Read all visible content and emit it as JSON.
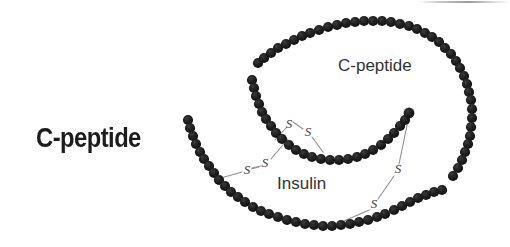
{
  "figure": {
    "name": "proinsulin-structure-diagram",
    "background_color": "#ffffff",
    "width": 510,
    "height": 247,
    "bead_color": "#1a1a1a",
    "bond_line_color": "#8a8a8a",
    "labels": {
      "main_c_peptide": "C-peptide",
      "inner_c_peptide": "C-peptide",
      "insulin": "Insulin"
    },
    "disulfide_bonds": [
      {
        "id": "bond-a6-a11-left",
        "left_label": "S",
        "right_label": "S"
      },
      {
        "id": "bond-a7-b7",
        "left_label": "S",
        "right_label": "S"
      },
      {
        "id": "bond-a20-b19",
        "left_label": "S",
        "right_label": "S"
      }
    ],
    "sulfur_glyphs": [
      {
        "id": "s-upper-left",
        "text": "S",
        "x": 287,
        "y": 124
      },
      {
        "id": "s-upper-right",
        "text": "S",
        "x": 307,
        "y": 133
      },
      {
        "id": "s-mid-left",
        "text": "S",
        "x": 245,
        "y": 170
      },
      {
        "id": "s-mid-right",
        "text": "S",
        "x": 263,
        "y": 163
      },
      {
        "id": "s-right-upper",
        "text": "S",
        "x": 397,
        "y": 170
      },
      {
        "id": "s-right-lower",
        "text": "S",
        "x": 373,
        "y": 205
      }
    ],
    "chains": [
      {
        "id": "c-peptide-outer-arc",
        "description": "outer spiral C-peptide chain",
        "beads": 78
      },
      {
        "id": "insulin-a-chain",
        "description": "inner insulin A chain",
        "beads": 31
      },
      {
        "id": "insulin-b-chain",
        "description": "lower insulin B chain",
        "beads": 38
      }
    ]
  }
}
